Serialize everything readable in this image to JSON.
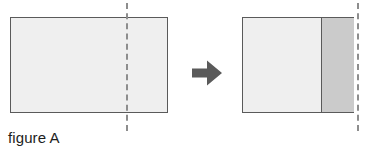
{
  "figure": {
    "caption": "figure A",
    "type": "paper-folding-diagram",
    "canvas": {
      "width": 370,
      "height": 155,
      "background": "#ffffff"
    },
    "colors": {
      "sheet_fill": "#efefef",
      "folded_flap_fill": "#cbcbcb",
      "outline": "#5a5a5a",
      "fold_line": "#8d8d8d",
      "arrow": "#5a5a5a",
      "caption_text": "#1d1d1d"
    },
    "before": {
      "label": "unfolded-sheet",
      "sheet": {
        "x": 10,
        "y": 17,
        "width": 158,
        "height": 96
      },
      "fold_line": {
        "x": 126,
        "y_top": 3,
        "y_bottom": 131,
        "orientation": "vertical",
        "style": "dashed"
      }
    },
    "transition": {
      "icon": "right-arrow-icon",
      "direction": "right",
      "x": 192,
      "y": 60,
      "width": 30,
      "height": 26
    },
    "after": {
      "label": "folded-sheet",
      "sheet": {
        "x": 242,
        "y": 17,
        "width": 112,
        "height": 96
      },
      "flap": {
        "x": 321,
        "y": 17,
        "width": 33,
        "height": 96
      },
      "fold_line": {
        "x": 357,
        "y_top": 3,
        "y_bottom": 131,
        "orientation": "vertical",
        "style": "dashed"
      }
    },
    "caption_position": {
      "x": 8,
      "y": 130
    }
  }
}
